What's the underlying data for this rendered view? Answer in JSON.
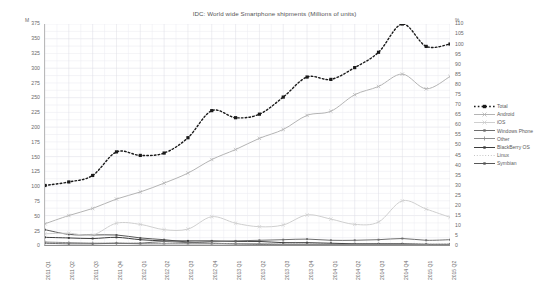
{
  "chart_data": {
    "type": "line",
    "title": "IDC: World wide Smartphone shipments (Millions of units)",
    "xlabel": "",
    "ylabel": "",
    "ylim": [
      0,
      375
    ],
    "y2lim": [
      0,
      110
    ],
    "ytick_step": 25,
    "y2tick_step": 5,
    "grid": true,
    "legend_position": "right",
    "left_axis_unit": "M",
    "right_axis_unit": "%",
    "categories": [
      "2011 Q1",
      "2011 Q2",
      "2011 Q3",
      "2011 Q4",
      "2012 Q1",
      "2012 Q2",
      "2012 Q3",
      "2012 Q4",
      "2013 Q1",
      "2013 Q2",
      "2013 Q3",
      "2013 Q4",
      "2014 Q1",
      "2014 Q2",
      "2014 Q3",
      "2014 Q4",
      "2015 Q1",
      "2015 Q2"
    ],
    "yticks": [
      0,
      25,
      50,
      75,
      100,
      125,
      150,
      175,
      200,
      225,
      250,
      275,
      300,
      325,
      350,
      375
    ],
    "y2ticks": [
      0,
      5,
      10,
      15,
      20,
      25,
      30,
      35,
      40,
      45,
      50,
      55,
      60,
      65,
      70,
      75,
      80,
      85,
      90,
      95,
      100,
      105,
      110
    ],
    "series": [
      {
        "name": "Total",
        "color": "#1a1a1a",
        "style": "dotted",
        "marker": "square",
        "width": 1.4,
        "values": [
          101,
          107,
          118,
          158,
          152,
          156,
          182,
          228,
          216,
          222,
          251,
          285,
          281,
          301,
          327,
          375,
          337,
          341
        ]
      },
      {
        "name": "Android",
        "color": "#b4b4b4",
        "style": "solid",
        "marker": "x",
        "width": 1.0,
        "values": [
          36,
          50,
          62,
          78,
          90,
          105,
          122,
          145,
          162,
          181,
          196,
          220,
          227,
          255,
          269,
          290,
          265,
          286
        ]
      },
      {
        "name": "iOS",
        "color": "#cfcfcf",
        "style": "solid",
        "marker": "x",
        "width": 1.0,
        "values": [
          19,
          20,
          17,
          37,
          35,
          26,
          27,
          48,
          37,
          31,
          34,
          51,
          44,
          35,
          39,
          75,
          61,
          47
        ]
      },
      {
        "name": "Windows Phone",
        "color": "#6e6e6e",
        "style": "solid",
        "marker": "square",
        "width": 1.0,
        "values": [
          3,
          2,
          2,
          3,
          3,
          6,
          4,
          6,
          7,
          8,
          9,
          10,
          8,
          8,
          9,
          11,
          8,
          9
        ]
      },
      {
        "name": "Other",
        "color": "#8c8c8c",
        "style": "solid",
        "marker": "plus",
        "width": 1.0,
        "values": [
          5,
          4,
          3,
          3,
          2,
          2,
          2,
          2,
          2,
          2,
          1,
          1,
          1,
          1,
          1,
          1,
          1,
          1
        ]
      },
      {
        "name": "BlackBerry OS",
        "color": "#3c3c3c",
        "style": "solid",
        "marker": "square",
        "width": 1.0,
        "values": [
          13,
          12,
          11,
          13,
          9,
          7,
          7,
          7,
          6,
          6,
          4,
          4,
          3,
          2,
          2,
          2,
          1,
          1
        ]
      },
      {
        "name": "Linux",
        "color": "#c6c6c6",
        "style": "dotted",
        "marker": "none",
        "width": 1.0,
        "values": [
          3,
          3,
          3,
          3,
          3,
          3,
          3,
          3,
          2,
          2,
          2,
          2,
          2,
          2,
          2,
          2,
          2,
          2
        ]
      },
      {
        "name": "Symbian",
        "color": "#575757",
        "style": "solid",
        "marker": "square",
        "width": 1.0,
        "values": [
          26,
          18,
          17,
          17,
          12,
          9,
          5,
          3,
          2,
          1,
          1,
          1,
          1,
          1,
          1,
          1,
          1,
          1
        ]
      }
    ]
  }
}
